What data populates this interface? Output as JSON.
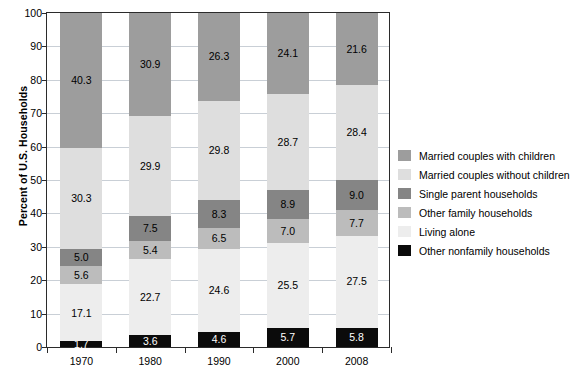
{
  "chart_data": {
    "type": "bar",
    "stacked": true,
    "title": "",
    "xlabel": "",
    "ylabel": "Percent of U.S. Households",
    "ylim": [
      0,
      100
    ],
    "yticks": [
      0,
      10,
      20,
      30,
      40,
      50,
      60,
      70,
      80,
      90,
      100
    ],
    "grid": true,
    "legend_position": "right",
    "categories": [
      "1970",
      "1980",
      "1990",
      "2000",
      "2008"
    ],
    "series": [
      {
        "name": "Other nonfamily households",
        "color": "#0b0b0b",
        "label_color": "#ffffff",
        "values": [
          1.7,
          3.6,
          4.6,
          5.7,
          5.8
        ],
        "labels": [
          "1.7",
          "3.6",
          "4.6",
          "5.7",
          "5.8"
        ]
      },
      {
        "name": "Living alone",
        "color": "#ededed",
        "label_color": "#000000",
        "values": [
          17.1,
          22.7,
          24.6,
          25.5,
          27.5
        ],
        "labels": [
          "17.1",
          "22.7",
          "24.6",
          "25.5",
          "27.5"
        ]
      },
      {
        "name": "Other family households",
        "color": "#bcbcbc",
        "label_color": "#000000",
        "values": [
          5.6,
          5.4,
          6.5,
          7.0,
          7.7
        ],
        "labels": [
          "5.6",
          "5.4",
          "6.5",
          "7.0",
          "7.7"
        ]
      },
      {
        "name": "Single parent households",
        "color": "#858585",
        "label_color": "#000000",
        "values": [
          5.0,
          7.5,
          8.3,
          8.9,
          9.0
        ],
        "labels": [
          "5.0",
          "7.5",
          "8.3",
          "8.9",
          "9.0"
        ]
      },
      {
        "name": "Married couples without children",
        "color": "#dedede",
        "label_color": "#000000",
        "values": [
          30.3,
          29.9,
          29.8,
          28.7,
          28.4
        ],
        "labels": [
          "30.3",
          "29.9",
          "29.8",
          "28.7",
          "28.4"
        ]
      },
      {
        "name": "Married couples with children",
        "color": "#9d9d9d",
        "label_color": "#000000",
        "values": [
          40.3,
          30.9,
          26.3,
          24.1,
          21.6
        ],
        "labels": [
          "40.3",
          "30.9",
          "26.3",
          "24.1",
          "21.6"
        ]
      }
    ]
  },
  "axis": {
    "y_title": "Percent of U.S. Households",
    "y_tick_labels": [
      "100",
      "90",
      "80",
      "70",
      "60",
      "50",
      "40",
      "30",
      "20",
      "10",
      "0"
    ],
    "x_tick_labels": [
      "1970",
      "1980",
      "1990",
      "2000",
      "2008"
    ]
  },
  "legend": {
    "items": [
      {
        "label": "Married couples with children",
        "swatch": "#9d9d9d"
      },
      {
        "label": "Married couples without children",
        "swatch": "#dedede"
      },
      {
        "label": "Single parent households",
        "swatch": "#858585"
      },
      {
        "label": "Other family households",
        "swatch": "#bcbcbc"
      },
      {
        "label": "Living alone",
        "swatch": "#ededed"
      },
      {
        "label": "Other nonfamily households",
        "swatch": "#0b0b0b"
      }
    ]
  }
}
